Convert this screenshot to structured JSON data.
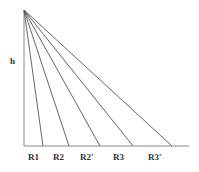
{
  "diagram": {
    "apex": {
      "x": 24,
      "y": 10
    },
    "baseline": {
      "y": 146,
      "x_start": 24,
      "x_end": 189
    },
    "rays": [
      {
        "label": "R1",
        "x_end": 43
      },
      {
        "label": "R2",
        "x_end": 69
      },
      {
        "label": "R2'",
        "x_end": 100
      },
      {
        "label": "R3",
        "x_end": 133
      },
      {
        "label": "R3'",
        "x_end": 172
      }
    ],
    "height_label": "h",
    "line_color": "#555555"
  }
}
